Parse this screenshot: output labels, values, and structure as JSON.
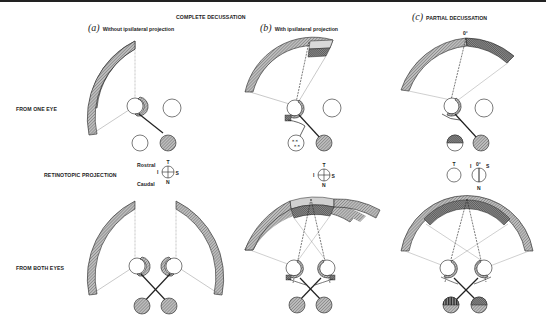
{
  "figure": {
    "header": "COMPLETE DECUSSATION",
    "panels": [
      {
        "letter": "(a)",
        "title": "Without ipsilateral projection"
      },
      {
        "letter": "(b)",
        "title": "With ipsilateral projection"
      },
      {
        "letter": "(c)",
        "title": "PARTIAL DECUSSATION"
      }
    ],
    "row_labels": {
      "one_eye": "FROM ONE EYE",
      "retinotopic": "RETINOTOPIC PROJECTION",
      "both_eyes": "FROM BOTH EYES"
    },
    "orientation": {
      "rostral": "Rostral",
      "caudal": "Caudal",
      "T": "T",
      "N": "N",
      "I": "I",
      "S": "S",
      "zero_deg": "0°"
    },
    "colors": {
      "line": "#222222",
      "hatch": "#9a9a9a",
      "dense_hatch": "#555555",
      "background": "#ffffff"
    }
  }
}
